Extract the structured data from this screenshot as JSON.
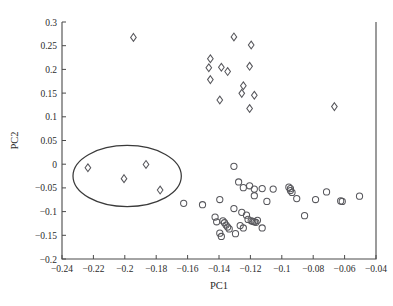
{
  "chart_data": {
    "type": "scatter",
    "title": "",
    "xlabel": "PC1",
    "ylabel": "PC2",
    "xlim": [
      -0.24,
      -0.04
    ],
    "ylim": [
      -0.2,
      0.3
    ],
    "xticks": [
      -0.24,
      -0.22,
      -0.2,
      -0.18,
      -0.16,
      -0.14,
      -0.12,
      -0.1,
      -0.08,
      -0.06,
      -0.04
    ],
    "yticks": [
      -0.2,
      -0.15,
      -0.1,
      -0.05,
      0,
      0.05,
      0.1,
      0.15,
      0.2,
      0.25,
      0.3
    ],
    "xticklabels": [
      "-0.24",
      "-0.22",
      "-0.2",
      "-0.18",
      "-0.16",
      "-0.14",
      "-0.12",
      "-0.1",
      "-0.08",
      "-0.06",
      "-0.04"
    ],
    "yticklabels": [
      "-0.2",
      "-0.15",
      "-0.1",
      "-0.05",
      "0",
      "0.05",
      "0.1",
      "0.15",
      "0.2",
      "0.25",
      "0.3"
    ],
    "grid": false,
    "legend": null,
    "series": [
      {
        "name": "diamonds",
        "marker": "diamond",
        "points": [
          [
            -0.1945,
            0.2675
          ],
          [
            -0.1305,
            0.2685
          ],
          [
            -0.1195,
            0.2515
          ],
          [
            -0.1455,
            0.2225
          ],
          [
            -0.1465,
            0.2035
          ],
          [
            -0.1205,
            0.2065
          ],
          [
            -0.1385,
            0.2045
          ],
          [
            -0.1345,
            0.1955
          ],
          [
            -0.1455,
            0.1785
          ],
          [
            -0.1245,
            0.1655
          ],
          [
            -0.1255,
            0.1495
          ],
          [
            -0.1395,
            0.1355
          ],
          [
            -0.1175,
            0.1455
          ],
          [
            -0.1205,
            0.1175
          ],
          [
            -0.0665,
            0.1215
          ],
          [
            -0.2235,
            -0.0075
          ],
          [
            -0.1865,
            -0.0005
          ],
          [
            -0.2005,
            -0.0305
          ],
          [
            -0.1775,
            -0.0545
          ]
        ]
      },
      {
        "name": "circles",
        "marker": "circle",
        "points": [
          [
            -0.1305,
            -0.0045
          ],
          [
            -0.1275,
            -0.0375
          ],
          [
            -0.1245,
            -0.0495
          ],
          [
            -0.1205,
            -0.0455
          ],
          [
            -0.1175,
            -0.0525
          ],
          [
            -0.1125,
            -0.0515
          ],
          [
            -0.1055,
            -0.0525
          ],
          [
            -0.1175,
            -0.0665
          ],
          [
            -0.1095,
            -0.0785
          ],
          [
            -0.0955,
            -0.0485
          ],
          [
            -0.0945,
            -0.0515
          ],
          [
            -0.0945,
            -0.0555
          ],
          [
            -0.0935,
            -0.0595
          ],
          [
            -0.0905,
            -0.0725
          ],
          [
            -0.0785,
            -0.0745
          ],
          [
            -0.0715,
            -0.0585
          ],
          [
            -0.0625,
            -0.0775
          ],
          [
            -0.0615,
            -0.0785
          ],
          [
            -0.0505,
            -0.0675
          ],
          [
            -0.0855,
            -0.1085
          ],
          [
            -0.1625,
            -0.0825
          ],
          [
            -0.1505,
            -0.0855
          ],
          [
            -0.1395,
            -0.0745
          ],
          [
            -0.1305,
            -0.0935
          ],
          [
            -0.1255,
            -0.1015
          ],
          [
            -0.1225,
            -0.1075
          ],
          [
            -0.1215,
            -0.1165
          ],
          [
            -0.1195,
            -0.1195
          ],
          [
            -0.1185,
            -0.1205
          ],
          [
            -0.1175,
            -0.1215
          ],
          [
            -0.1165,
            -0.1225
          ],
          [
            -0.1155,
            -0.1185
          ],
          [
            -0.1265,
            -0.1295
          ],
          [
            -0.1245,
            -0.1345
          ],
          [
            -0.1125,
            -0.1345
          ],
          [
            -0.1425,
            -0.1115
          ],
          [
            -0.1415,
            -0.1215
          ],
          [
            -0.1375,
            -0.1195
          ],
          [
            -0.1365,
            -0.1235
          ],
          [
            -0.1355,
            -0.1285
          ],
          [
            -0.1345,
            -0.1325
          ],
          [
            -0.1335,
            -0.1365
          ],
          [
            -0.1395,
            -0.1455
          ],
          [
            -0.1385,
            -0.1525
          ],
          [
            -0.1295,
            -0.1465
          ]
        ]
      }
    ],
    "annotations": [
      {
        "name": "cluster-ellipse",
        "shape": "ellipse",
        "cx": -0.1985,
        "cy": -0.025,
        "rx": 0.0345,
        "ry": 0.0645
      }
    ]
  }
}
